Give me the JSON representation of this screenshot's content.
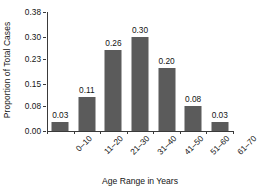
{
  "chart_data": {
    "type": "bar",
    "title": "",
    "xlabel": "Age Range in Years",
    "ylabel": "Proportion of Total Cases",
    "categories": [
      "0–10",
      "11–20",
      "21–30",
      "31–40",
      "41–50",
      "51–60",
      "61–70"
    ],
    "values": [
      0.03,
      0.11,
      0.26,
      0.3,
      0.2,
      0.08,
      0.03
    ],
    "value_labels": [
      "0.03",
      "0.11",
      "0.26",
      "0.30",
      "0.20",
      "0.08",
      "0.03"
    ],
    "ylim": [
      0.0,
      0.38
    ],
    "yticks": [
      0.0,
      0.08,
      0.15,
      0.23,
      0.3,
      0.38
    ],
    "ytick_labels": [
      "0.00",
      "0.08",
      "0.15",
      "0.23",
      "0.30",
      "0.38"
    ],
    "grid": false,
    "legend": false,
    "bar_color": "#5b5b5b",
    "axis_color": "#3a3a3a",
    "background_color": "#ffffff",
    "text_color": "#141414"
  }
}
